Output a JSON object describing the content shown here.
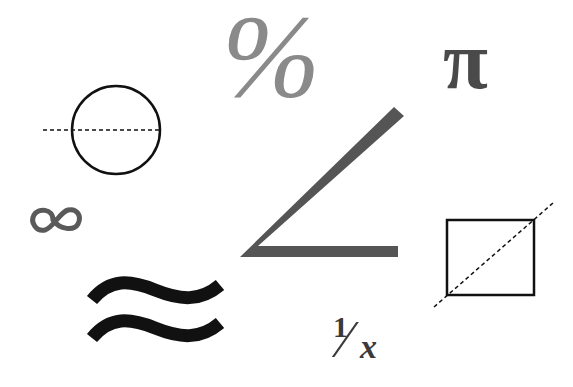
{
  "symbols": {
    "percent": {
      "glyph": "%",
      "color": "#8a8a8a"
    },
    "pi": {
      "glyph": "π",
      "color": "#4a4a4a"
    },
    "reciprocal": {
      "numerator": "1",
      "slash": "⁄",
      "denominator": "x",
      "color": "#3a3a3a"
    },
    "infinity": {
      "name": "infinity-icon",
      "color": "#5a5a5a"
    },
    "approximately": {
      "name": "approximately-equal-icon",
      "color": "#111111"
    },
    "angle": {
      "name": "angle-icon",
      "color": "#555555"
    },
    "circle_diameter": {
      "name": "circle-with-diameter-icon",
      "color": "#111111"
    },
    "square_diagonal": {
      "name": "square-with-diagonal-icon",
      "color": "#111111"
    }
  }
}
